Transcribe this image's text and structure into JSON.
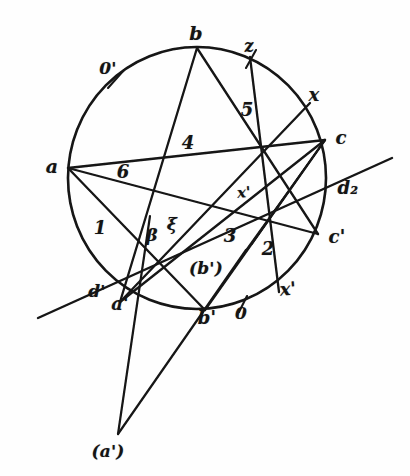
{
  "figure": {
    "kind": "hand-drawn geometric construction",
    "ink_color": "#141414",
    "paper_color": "#fefefe"
  },
  "circle": {
    "center_x": 197,
    "center_y": 178,
    "radius_x": 129,
    "radius_y": 131
  },
  "points": [
    {
      "id": "b",
      "label": "b",
      "x": 197,
      "y": 48,
      "label_x": 196,
      "label_y": 33
    },
    {
      "id": "a",
      "label": "a",
      "x": 68,
      "y": 168,
      "label_x": 52,
      "label_y": 166
    },
    {
      "id": "c",
      "label": "c",
      "x": 325,
      "y": 140,
      "label_x": 341,
      "label_y": 138
    },
    {
      "id": "cp",
      "label": "c'",
      "x": 318,
      "y": 234,
      "label_x": 337,
      "label_y": 237
    },
    {
      "id": "ap",
      "label": "a'",
      "x": 120,
      "y": 302,
      "label_x": 120,
      "label_y": 304
    },
    {
      "id": "bp",
      "label": "b'",
      "x": 205,
      "y": 310,
      "label_x": 207,
      "label_y": 318
    },
    {
      "id": "d2",
      "label": "d₂",
      "x": 334,
      "y": 187,
      "label_x": 348,
      "label_y": 188
    },
    {
      "id": "dp",
      "label": "d'",
      "x": 100,
      "y": 287,
      "label_x": 97,
      "label_y": 291
    },
    {
      "id": "xtop",
      "label": "z",
      "x": 250,
      "y": 57,
      "label_x": 249,
      "label_y": 46
    },
    {
      "id": "xrt",
      "label": "x",
      "x": 310,
      "y": 103,
      "label_x": 314,
      "label_y": 95
    },
    {
      "id": "xbot",
      "label": "x'",
      "x": 279,
      "y": 292,
      "label_x": 288,
      "label_y": 289
    },
    {
      "id": "zero_prime",
      "label": "0'",
      "x": 114,
      "y": 77,
      "label_x": 108,
      "label_y": 68
    },
    {
      "id": "zero",
      "label": "0",
      "x": 243,
      "y": 305,
      "label_x": 241,
      "label_y": 313
    },
    {
      "id": "apex",
      "label": "(a')",
      "x": 118,
      "y": 434,
      "label_x": 108,
      "label_y": 451
    },
    {
      "id": "bparen",
      "label": "(b')",
      "x": 206,
      "y": 268,
      "label_x": 206,
      "label_y": 268
    },
    {
      "id": "xi",
      "label": "ξ",
      "x": 172,
      "y": 224,
      "label_x": 172,
      "label_y": 224
    },
    {
      "id": "beta",
      "label": "β",
      "x": 152,
      "y": 235,
      "label_x": 152,
      "label_y": 235
    },
    {
      "id": "xprime_inner",
      "label": "x'",
      "x": 244,
      "y": 193,
      "label_x": 244,
      "label_y": 193
    }
  ],
  "region_labels": [
    {
      "id": "n1",
      "text": "1",
      "x": 100,
      "y": 228
    },
    {
      "id": "n2",
      "text": "2",
      "x": 268,
      "y": 249
    },
    {
      "id": "n3",
      "text": "3",
      "x": 230,
      "y": 236
    },
    {
      "id": "n4",
      "text": "4",
      "x": 188,
      "y": 143
    },
    {
      "id": "n5",
      "text": "5",
      "x": 247,
      "y": 110
    },
    {
      "id": "n6",
      "text": "6",
      "x": 123,
      "y": 172
    }
  ],
  "tick_marks": [
    {
      "id": "tick-0prime",
      "x1": 108,
      "y1": 88,
      "x2": 124,
      "y2": 70
    },
    {
      "id": "tick-ztop",
      "x1": 246,
      "y1": 68,
      "x2": 256,
      "y2": 50
    },
    {
      "id": "tick-0bot",
      "x1": 239,
      "y1": 312,
      "x2": 247,
      "y2": 296
    }
  ],
  "chords": [
    {
      "id": "b-to-ap",
      "from": "b",
      "to": "ap",
      "note": "chord 4"
    },
    {
      "id": "b-to-cp",
      "from": "b",
      "to": "cp",
      "note": "chord 5"
    },
    {
      "id": "a-to-c",
      "from": "a",
      "to": "c",
      "note": "chord 6"
    },
    {
      "id": "a-to-bp",
      "from": "a",
      "to": "bp",
      "note": "chord 1"
    },
    {
      "id": "a-to-cp",
      "from": "a",
      "to": "cp",
      "note": "long chord to c'"
    },
    {
      "id": "ap-to-c",
      "from": "ap",
      "to": "c",
      "note": "chord"
    },
    {
      "id": "ap-to-xrt",
      "from": "ap",
      "to": "xrt",
      "note": "chord"
    },
    {
      "id": "bp-to-c",
      "from": "bp",
      "to": "c",
      "note": "chord"
    },
    {
      "id": "xtop-to-xbot",
      "from": "xtop",
      "to": "xbot",
      "note": "chord z-x'"
    }
  ],
  "external_lines": [
    {
      "id": "pascal-line",
      "x1": 38,
      "y1": 318,
      "x2": 392,
      "y2": 158,
      "note": "through d', d2"
    },
    {
      "id": "apex-left",
      "x1": 150,
      "y1": 216,
      "x2": 118,
      "y2": 434,
      "note": "to (a')"
    },
    {
      "id": "apex-right",
      "x1": 246,
      "y1": 250,
      "x2": 118,
      "y2": 434,
      "note": "to (a')"
    }
  ],
  "caption": {
    "bottom_apex": "(a')"
  }
}
